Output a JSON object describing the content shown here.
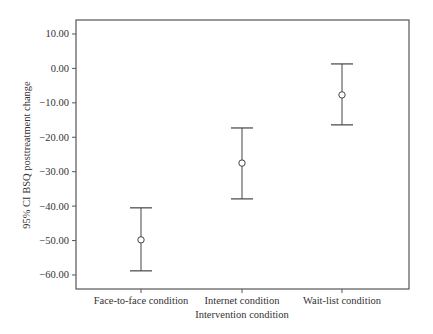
{
  "chart_data": {
    "type": "errorbar",
    "title": "",
    "xlabel": "Intervention condition",
    "ylabel": "95% CI BSQ posttreatment change",
    "categories": [
      "Face-to-face condition",
      "Internet condition",
      "Wait-list condition"
    ],
    "series": [
      {
        "name": "BSQ posttreatment change",
        "mean": [
          -49.8,
          -27.5,
          -7.7
        ],
        "ci_upper": [
          -40.5,
          -17.3,
          1.3
        ],
        "ci_lower": [
          -58.8,
          -37.9,
          -16.4
        ]
      }
    ],
    "yticks": [
      10,
      0,
      -10,
      -20,
      -30,
      -40,
      -50,
      -60
    ],
    "ytick_labels": [
      "10.00",
      "0.00",
      "−10.00",
      "−20.00",
      "−30.00",
      "−40.00",
      "−50.00",
      "−60.00"
    ],
    "ylim": [
      -64,
      14
    ],
    "grid": false,
    "legend": "none",
    "colors": {
      "frame": "#555555",
      "bars": "#444444",
      "marker": "#444444",
      "text": "#333333"
    }
  },
  "labels": {
    "ylabel": "95% CI BSQ posttreatment change",
    "xlabel": "Intervention condition",
    "cat0": "Face-to-face condition",
    "cat1": "Internet condition",
    "cat2": "Wait-list condition"
  }
}
